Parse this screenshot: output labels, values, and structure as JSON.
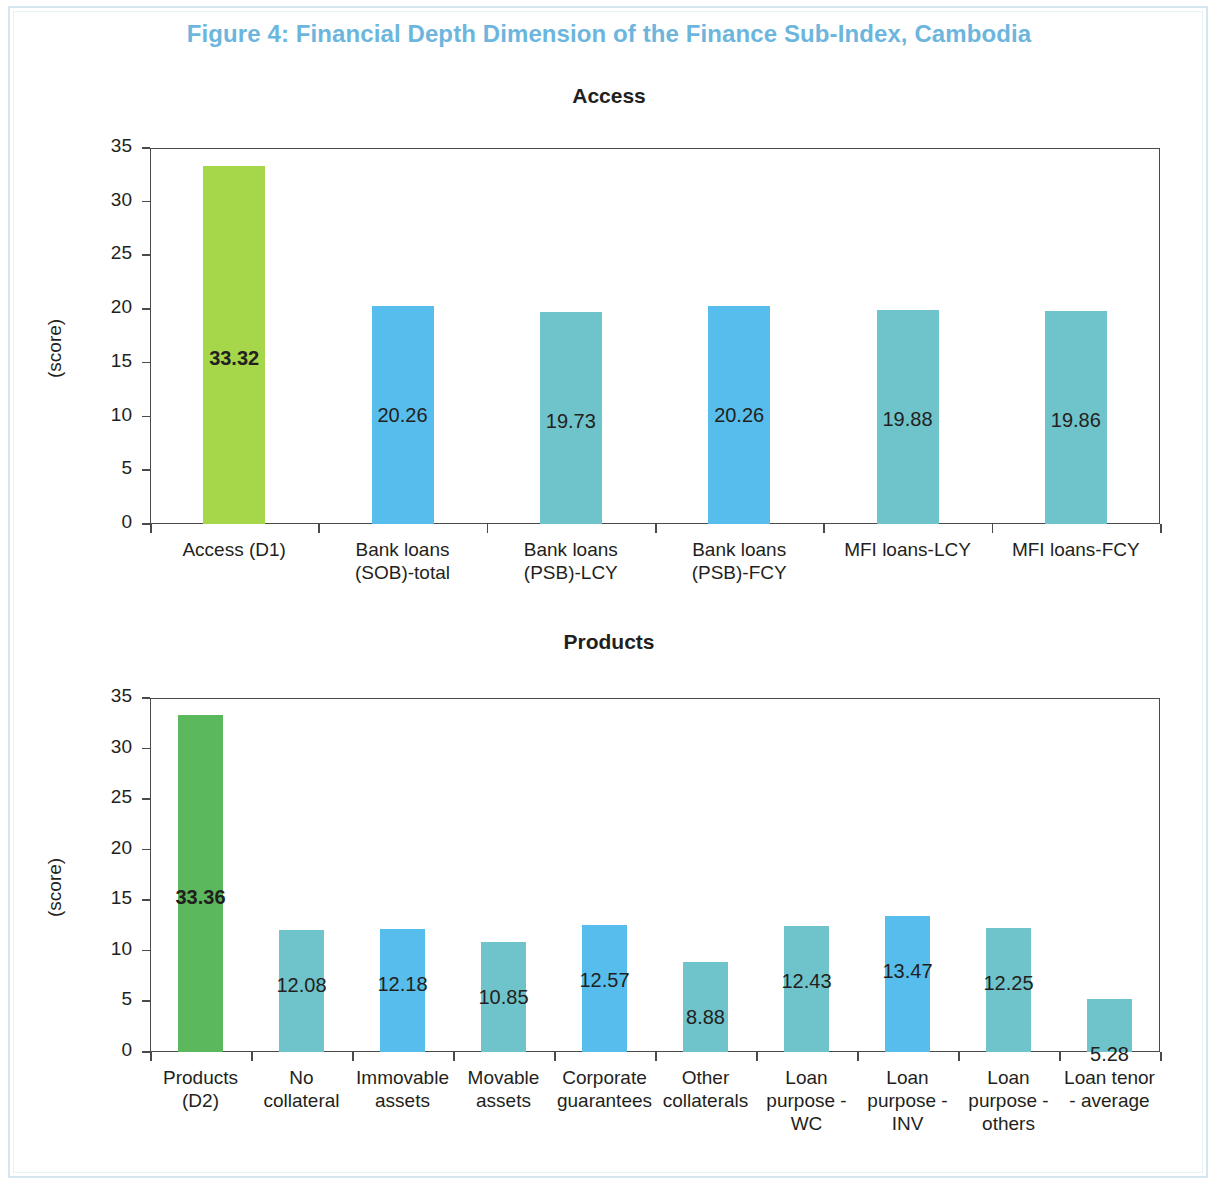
{
  "figure": {
    "title": "Figure 4: Financial Depth Dimension of the Finance Sub-Index, Cambodia",
    "title_color": "#6cb6dd"
  },
  "colors": {
    "green_light": "#a6d64a",
    "green": "#5cb85c",
    "blue": "#56bdec",
    "teal": "#6fc3cb",
    "axis": "#4a4a48",
    "text": "#231f20"
  },
  "chart_data": [
    {
      "type": "bar",
      "title": "Access",
      "xlabel": "",
      "ylabel": "(score)",
      "ylim": [
        0,
        35
      ],
      "yticks": [
        0,
        5,
        10,
        15,
        20,
        25,
        30,
        35
      ],
      "ytick_labels": [
        "0",
        "5",
        "10",
        "15",
        "20",
        "25",
        "30",
        "35"
      ],
      "grid": false,
      "legend": "none",
      "categories": [
        "Access (D1)",
        "Bank loans (SOB)-total",
        "Bank loans (PSB)-LCY",
        "Bank loans (PSB)-FCY",
        "MFI loans-LCY",
        "MFI loans-FCY"
      ],
      "category_lines": [
        [
          "Access (D1)"
        ],
        [
          "Bank loans",
          "(SOB)-total"
        ],
        [
          "Bank loans",
          "(PSB)-LCY"
        ],
        [
          "Bank loans",
          "(PSB)-FCY"
        ],
        [
          "MFI loans-LCY"
        ],
        [
          "MFI loans-FCY"
        ]
      ],
      "values": [
        33.32,
        20.26,
        19.73,
        20.26,
        19.88,
        19.86
      ],
      "value_labels": [
        "33.32",
        "20.26",
        "19.73",
        "20.26",
        "19.88",
        "19.86"
      ],
      "bar_colors": [
        "#a6d64a",
        "#56bdec",
        "#6fc3cb",
        "#56bdec",
        "#6fc3cb",
        "#6fc3cb"
      ],
      "label_bold": [
        true,
        false,
        false,
        false,
        false,
        false
      ]
    },
    {
      "type": "bar",
      "title": "Products",
      "xlabel": "",
      "ylabel": "(score)",
      "ylim": [
        0,
        35
      ],
      "yticks": [
        0,
        5,
        10,
        15,
        20,
        25,
        30,
        35
      ],
      "ytick_labels": [
        "0",
        "5",
        "10",
        "15",
        "20",
        "25",
        "30",
        "35"
      ],
      "grid": false,
      "legend": "none",
      "categories": [
        "Products (D2)",
        "No collateral",
        "Immovable assets",
        "Movable assets",
        "Corporate guarantees",
        "Other collaterals",
        "Loan purpose - WC",
        "Loan purpose - INV",
        "Loan purpose - others",
        "Loan tenor - average"
      ],
      "category_lines": [
        [
          "Products",
          "(D2)"
        ],
        [
          "No",
          "collateral"
        ],
        [
          "Immovable",
          "assets"
        ],
        [
          "Movable",
          "assets"
        ],
        [
          "Corporate",
          "guarantees"
        ],
        [
          "Other",
          "collaterals"
        ],
        [
          "Loan",
          "purpose -",
          "WC"
        ],
        [
          "Loan",
          "purpose -",
          "INV"
        ],
        [
          "Loan",
          "purpose -",
          "others"
        ],
        [
          "Loan tenor",
          "- average"
        ]
      ],
      "values": [
        33.36,
        12.08,
        12.18,
        10.85,
        12.57,
        8.88,
        12.43,
        13.47,
        12.25,
        5.28
      ],
      "value_labels": [
        "33.36",
        "12.08",
        "12.18",
        "10.85",
        "12.57",
        "8.88",
        "12.43",
        "13.47",
        "12.25",
        "5.28"
      ],
      "bar_colors": [
        "#5cb85c",
        "#6fc3cb",
        "#56bdec",
        "#6fc3cb",
        "#56bdec",
        "#6fc3cb",
        "#6fc3cb",
        "#56bdec",
        "#6fc3cb",
        "#6fc3cb"
      ],
      "label_bold": [
        true,
        false,
        false,
        false,
        false,
        false,
        false,
        false,
        false,
        false
      ]
    }
  ]
}
